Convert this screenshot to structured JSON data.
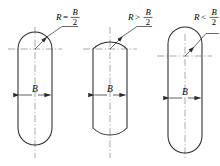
{
  "diagram": {
    "stroke_color": "#2b2b2b",
    "centerline_color": "#6f6f6f",
    "background": "#ffffff",
    "width_symbol": "B",
    "radius_symbol": "R",
    "fraction_numerator": "B",
    "fraction_denominator": "2",
    "figures": [
      {
        "id": "figure-1",
        "relation_operator": "=",
        "note": "R= B/2",
        "dimension_label": "B",
        "shape": "stadium-full-semicircular-ends",
        "description": "End radius equals half the width; arcs are tangent to the straight sides"
      },
      {
        "id": "figure-2",
        "relation_operator": ">",
        "note": "R> B/2",
        "dimension_label": "B",
        "shape": "stadium-flattened-large-radius-ends",
        "description": "End radius greater than half the width; flatter arcs"
      },
      {
        "id": "figure-3",
        "relation_operator": "<",
        "note": "R< B/2",
        "dimension_label": "B",
        "shape": "slot-small-radius-ends-with-shoulder-notches",
        "description": "End radius less than half the width; step notches appear at the shoulders"
      }
    ]
  }
}
